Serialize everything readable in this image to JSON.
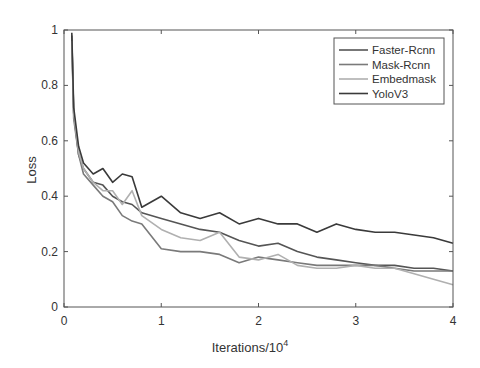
{
  "chart_data": {
    "type": "line",
    "title": "",
    "xlabel": "Iterations/10",
    "xlabel_sup": "4",
    "ylabel": "Loss",
    "xlim": [
      0,
      4
    ],
    "ylim": [
      0,
      1
    ],
    "xticks": [
      "0",
      "1",
      "2",
      "3",
      "4"
    ],
    "yticks": [
      "0",
      "0.2",
      "0.4",
      "0.6",
      "0.8",
      "1"
    ],
    "grid": false,
    "legend_position": "upper right",
    "series": [
      {
        "name": "Faster-Rcnn",
        "color": "#555555",
        "x": [
          0.08,
          0.1,
          0.15,
          0.2,
          0.3,
          0.4,
          0.5,
          0.6,
          0.7,
          0.8,
          1.0,
          1.2,
          1.4,
          1.6,
          1.8,
          2.0,
          2.2,
          2.4,
          2.6,
          2.8,
          3.0,
          3.2,
          3.4,
          3.6,
          3.8,
          4.0
        ],
        "y": [
          0.98,
          0.7,
          0.55,
          0.5,
          0.45,
          0.44,
          0.4,
          0.38,
          0.37,
          0.34,
          0.32,
          0.3,
          0.28,
          0.27,
          0.24,
          0.22,
          0.23,
          0.2,
          0.18,
          0.17,
          0.16,
          0.15,
          0.15,
          0.14,
          0.14,
          0.13
        ]
      },
      {
        "name": "Mask-Rcnn",
        "color": "#7a7a7a",
        "x": [
          0.08,
          0.1,
          0.15,
          0.2,
          0.3,
          0.4,
          0.5,
          0.6,
          0.7,
          0.8,
          1.0,
          1.2,
          1.4,
          1.6,
          1.8,
          2.0,
          2.2,
          2.4,
          2.6,
          2.8,
          3.0,
          3.2,
          3.4,
          3.6,
          3.8,
          4.0
        ],
        "y": [
          0.97,
          0.68,
          0.55,
          0.48,
          0.44,
          0.4,
          0.38,
          0.33,
          0.31,
          0.3,
          0.21,
          0.2,
          0.2,
          0.19,
          0.16,
          0.18,
          0.17,
          0.16,
          0.15,
          0.15,
          0.15,
          0.15,
          0.14,
          0.13,
          0.13,
          0.13
        ]
      },
      {
        "name": "Embedmask",
        "color": "#b0b0b0",
        "x": [
          0.08,
          0.1,
          0.15,
          0.2,
          0.3,
          0.4,
          0.5,
          0.6,
          0.7,
          0.8,
          1.0,
          1.2,
          1.4,
          1.6,
          1.8,
          2.0,
          2.2,
          2.4,
          2.6,
          2.8,
          3.0,
          3.2,
          3.4,
          3.6,
          3.8,
          4.0
        ],
        "y": [
          0.96,
          0.7,
          0.56,
          0.5,
          0.45,
          0.42,
          0.42,
          0.37,
          0.42,
          0.33,
          0.28,
          0.25,
          0.24,
          0.27,
          0.18,
          0.17,
          0.19,
          0.15,
          0.14,
          0.14,
          0.15,
          0.14,
          0.14,
          0.12,
          0.1,
          0.08
        ]
      },
      {
        "name": "YoloV3",
        "color": "#3a3a3a",
        "x": [
          0.08,
          0.1,
          0.15,
          0.2,
          0.3,
          0.4,
          0.5,
          0.6,
          0.7,
          0.8,
          1.0,
          1.2,
          1.4,
          1.6,
          1.8,
          2.0,
          2.2,
          2.4,
          2.6,
          2.8,
          3.0,
          3.2,
          3.4,
          3.6,
          3.8,
          4.0
        ],
        "y": [
          0.99,
          0.72,
          0.58,
          0.52,
          0.48,
          0.5,
          0.45,
          0.48,
          0.47,
          0.36,
          0.4,
          0.34,
          0.32,
          0.34,
          0.3,
          0.32,
          0.3,
          0.3,
          0.27,
          0.3,
          0.28,
          0.27,
          0.27,
          0.26,
          0.25,
          0.23
        ]
      }
    ]
  }
}
